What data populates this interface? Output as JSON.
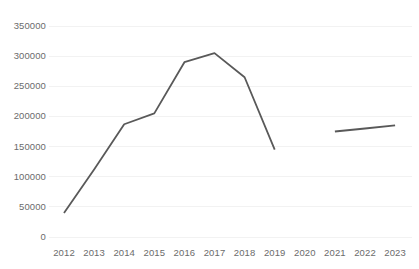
{
  "chart_data": {
    "type": "line",
    "title": "",
    "xlabel": "",
    "ylabel": "",
    "x": [
      2012,
      2013,
      2014,
      2015,
      2016,
      2017,
      2018,
      2019,
      2020,
      2021,
      2022,
      2023
    ],
    "categories": [
      "2012",
      "2013",
      "2014",
      "2015",
      "2016",
      "2017",
      "2018",
      "2019",
      "2020",
      "2021",
      "2022",
      "2023"
    ],
    "series": [
      {
        "name": "Series 1",
        "values": [
          40000,
          112000,
          187000,
          205000,
          290000,
          305000,
          265000,
          145000,
          null,
          175000,
          180000,
          185000
        ],
        "color": "#595959"
      }
    ],
    "ylim": [
      0,
      350000
    ],
    "yticks": [
      0,
      50000,
      100000,
      150000,
      200000,
      250000,
      300000,
      350000
    ],
    "ytick_labels": [
      "0",
      "50000",
      "100000",
      "150000",
      "200000",
      "250000",
      "300000",
      "350000"
    ],
    "xtick_labels": [
      "2012",
      "2013",
      "2014",
      "2015",
      "2016",
      "2017",
      "2018",
      "2019",
      "2020",
      "2021",
      "2022",
      "2023"
    ],
    "grid": true,
    "grid_axis": "y",
    "grid_color": "#f2f2f2",
    "legend": false,
    "legend_position": "none",
    "line_color": "#595959",
    "line_width": 1.8,
    "markers": false,
    "gap_years": [
      "2020"
    ],
    "annotations": []
  }
}
